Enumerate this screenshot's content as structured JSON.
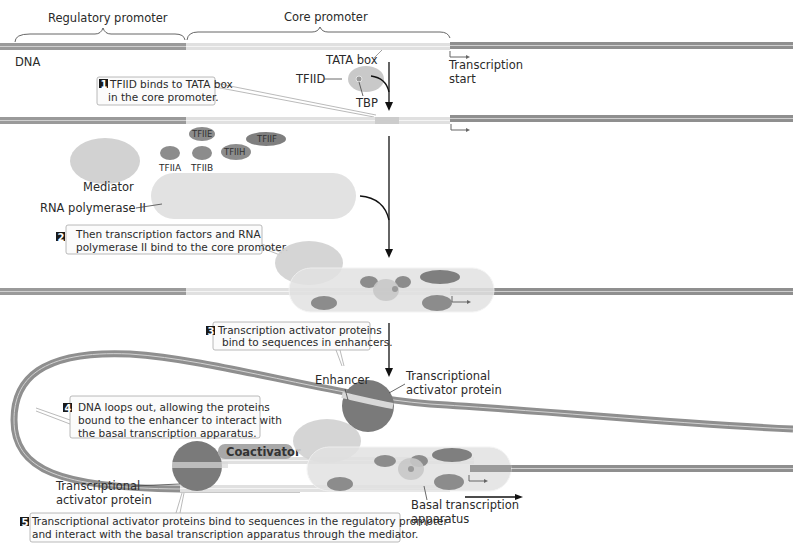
{
  "labels": {
    "regulatory_promoter": "Regulatory promoter",
    "core_promoter": "Core promoter",
    "dna": "DNA",
    "tata_box": "TATA box",
    "tfiid": "TFIID",
    "tbp": "TBP",
    "transcription_start_line1": "Transcription",
    "transcription_start_line2": "start",
    "mediator": "Mediator",
    "rna_pol": "RNA polymerase II",
    "enhancer": "Enhancer",
    "activator_right_line1": "Transcriptional",
    "activator_right_line2": "activator protein",
    "activator_left_line1": "Transcriptional",
    "activator_left_line2": "activator protein",
    "coactivator": "Coactivator",
    "basal_line1": "Basal transcription",
    "basal_line2": "apparatus"
  },
  "factors": {
    "tfiia": "TFIIA",
    "tfiib": "TFIIB",
    "tfiie": "TFIIE",
    "tfiif": "TFIIF",
    "tfiih": "TFIIH"
  },
  "steps": [
    {
      "num": "1",
      "line1": "TFIID binds to TATA box",
      "line2": "in the core promoter."
    },
    {
      "num": "2",
      "line1": "Then transcription factors and RNA",
      "line2": "polymerase II bind to the core promoter."
    },
    {
      "num": "3",
      "line1": "Transcription activator proteins",
      "line2": "bind to sequences in enhancers."
    },
    {
      "num": "4",
      "line1": "DNA loops out, allowing the proteins",
      "line2": "bound to the enhancer to interact with",
      "line3": "the basal transcription apparatus."
    },
    {
      "num": "5",
      "line1": "Transcriptional activator proteins bind to sequences in the regulatory promoter",
      "line2": "and interact with the basal transcription apparatus through the mediator."
    }
  ],
  "colors": {
    "dna_dark": "#8f8f8f",
    "dna_light": "#d8d8d8",
    "protein_dark": "#7a7a7a",
    "protein_mid": "#9a9a9a",
    "protein_light": "#d4d4d4",
    "polymerase": "#e2e2e2",
    "badge": "#1a1a1a"
  }
}
